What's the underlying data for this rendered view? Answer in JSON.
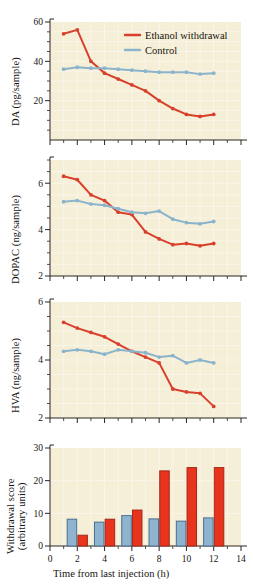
{
  "figure": {
    "background": "#f6efd8",
    "series_colors": {
      "ethanol": "#d8402b",
      "control": "#8ab4cc"
    },
    "bar_colors": {
      "ethanol_fill": "#e8341d",
      "ethanol_stroke": "#a3281a",
      "control_fill": "#8fb4d0",
      "control_stroke": "#4b6f90"
    },
    "legend": {
      "position": "top-right-panel-1",
      "entries": [
        {
          "label": "Ethanol withdrawal",
          "color": "#d8402b"
        },
        {
          "label": "Control",
          "color": "#8ab4cc"
        }
      ]
    },
    "x_axis": {
      "label": "Time from last injection (h)",
      "min": 0,
      "max": 14,
      "major_ticks": [
        0,
        2,
        4,
        6,
        8,
        10,
        12,
        14
      ],
      "minor_ticks": [
        1,
        3,
        5,
        7,
        9,
        11,
        13
      ],
      "tick_labels": [
        "0",
        "2",
        "4",
        "6",
        "8",
        "10",
        "12",
        "14"
      ]
    }
  },
  "chart_data": [
    {
      "type": "line",
      "panel": 1,
      "title": "",
      "xlabel": "Time from last injection (h)",
      "ylabel": "DA (pg/sample)",
      "xlim": [
        0,
        14
      ],
      "ylim": [
        0,
        60
      ],
      "ytick_labels": [
        "20",
        "40",
        "60"
      ],
      "yticks": [
        20,
        40,
        60
      ],
      "yminor": [
        5,
        10,
        15,
        25,
        30,
        35,
        45,
        50,
        55
      ],
      "grid": true,
      "legend": "top-right",
      "x": [
        1,
        2,
        3,
        4,
        5,
        6,
        7,
        8,
        9,
        10,
        11,
        12
      ],
      "series": [
        {
          "name": "Ethanol withdrawal",
          "color": "#d8402b",
          "values": [
            54,
            56,
            40,
            34,
            31,
            28,
            25,
            20,
            16,
            13,
            12,
            13
          ]
        },
        {
          "name": "Control",
          "color": "#8ab4cc",
          "values": [
            36,
            37,
            36.5,
            36.5,
            36,
            35.5,
            35,
            34.5,
            34.5,
            34.5,
            33.5,
            34
          ]
        }
      ]
    },
    {
      "type": "line",
      "panel": 2,
      "title": "",
      "xlabel": "Time from last injection (h)",
      "ylabel": "DOPAC (ng/sample)",
      "xlim": [
        0,
        14
      ],
      "ylim": [
        2,
        7
      ],
      "ytick_labels": [
        "2",
        "4",
        "6"
      ],
      "yticks": [
        2,
        4,
        6
      ],
      "yminor": [
        2.5,
        3,
        3.5,
        4.5,
        5,
        5.5,
        6.5,
        7
      ],
      "grid": true,
      "x": [
        1,
        2,
        3,
        4,
        5,
        6,
        7,
        8,
        9,
        10,
        11,
        12
      ],
      "series": [
        {
          "name": "Ethanol withdrawal",
          "color": "#d8402b",
          "values": [
            6.3,
            6.15,
            5.5,
            5.25,
            4.75,
            4.65,
            3.9,
            3.6,
            3.35,
            3.4,
            3.3,
            3.4
          ]
        },
        {
          "name": "Control",
          "color": "#8ab4cc",
          "values": [
            5.2,
            5.25,
            5.1,
            5.05,
            4.9,
            4.75,
            4.7,
            4.8,
            4.45,
            4.3,
            4.25,
            4.35
          ]
        }
      ]
    },
    {
      "type": "line",
      "panel": 3,
      "title": "",
      "xlabel": "Time from last injection (h)",
      "ylabel": "HVA (ng/sample)",
      "xlim": [
        0,
        14
      ],
      "ylim": [
        2,
        6
      ],
      "ytick_labels": [
        "2",
        "4",
        "6"
      ],
      "yticks": [
        2,
        4,
        6
      ],
      "yminor": [
        2.5,
        3,
        3.5,
        4.5,
        5,
        5.5
      ],
      "grid": true,
      "x": [
        1,
        2,
        3,
        4,
        5,
        6,
        7,
        8,
        9,
        10,
        11,
        12
      ],
      "series": [
        {
          "name": "Ethanol withdrawal",
          "color": "#d8402b",
          "values": [
            5.3,
            5.1,
            4.95,
            4.8,
            4.55,
            4.3,
            4.1,
            3.9,
            3.0,
            2.9,
            2.85,
            2.4
          ]
        },
        {
          "name": "Control",
          "color": "#8ab4cc",
          "values": [
            4.3,
            4.35,
            4.3,
            4.2,
            4.35,
            4.3,
            4.25,
            4.1,
            4.15,
            3.9,
            4.0,
            3.9
          ]
        }
      ]
    },
    {
      "type": "bar",
      "panel": 4,
      "title": "",
      "xlabel": "Time from last injection (h)",
      "ylabel": "Withdrawal score (arbitrary units)",
      "ylabel_line1": "Withdrawal score",
      "ylabel_line2": "(arbitrary units)",
      "xlim": [
        0,
        14
      ],
      "ylim": [
        0,
        30
      ],
      "ytick_labels": [
        "0",
        "10",
        "20",
        "30"
      ],
      "yticks": [
        0,
        10,
        20,
        30
      ],
      "grid": true,
      "categories": [
        2,
        4,
        6,
        8,
        10,
        12
      ],
      "series": [
        {
          "name": "Control",
          "color": "#8fb4d0",
          "values": [
            8.2,
            7.3,
            9.3,
            8.3,
            7.6,
            8.6
          ]
        },
        {
          "name": "Ethanol withdrawal",
          "color": "#e8341d",
          "values": [
            3.3,
            8.2,
            11.0,
            23.0,
            24.0,
            24.0
          ]
        }
      ]
    }
  ]
}
